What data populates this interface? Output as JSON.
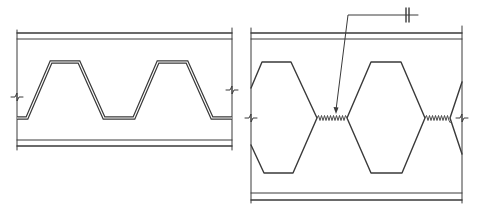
{
  "diagram": {
    "type": "engineering-section-drawing",
    "ink_color": "#3a3a3a",
    "background": "#ffffff",
    "panels": [
      {
        "id": "left",
        "description": "Beam with trapezoidal corrugated web between top and bottom flanges",
        "web_profile": "trapezoidal",
        "break_marks": 2
      },
      {
        "id": "right",
        "description": "Castellated beam with hexagonal openings and welded web joints",
        "web_profile": "hexagonal-openings",
        "weld_joints": 2,
        "leader": {
          "symbol": "weld-symbol-double-bar"
        },
        "break_marks": 2
      }
    ]
  }
}
